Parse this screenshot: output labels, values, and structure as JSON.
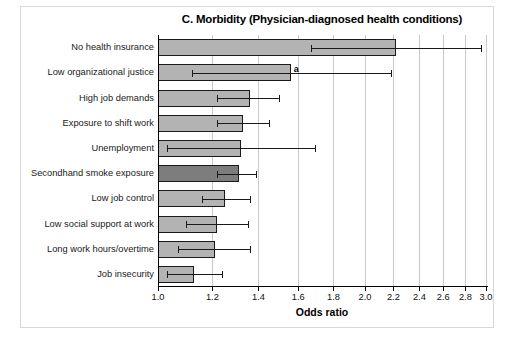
{
  "chart_data": {
    "type": "bar",
    "orientation": "horizontal",
    "title": "C. Morbidity (Physician-diagnosed health conditions)",
    "xlabel": "Odds ratio",
    "ylabel": "",
    "xscale": "log",
    "xlim": [
      1.0,
      3.0
    ],
    "grid": true,
    "legend": "none",
    "xticks": [
      1.0,
      1.2,
      1.4,
      1.6,
      1.8,
      2.0,
      2.2,
      2.4,
      2.6,
      2.8,
      3.0
    ],
    "xticklabels": [
      "1.0",
      "1.2",
      "1.4",
      "1.6",
      "1.8",
      "2.0",
      "2.2",
      "2.4",
      "2.6",
      "2.8",
      "3.0"
    ],
    "categories": [
      "No health insurance",
      "Low organizational justice",
      "High job demands",
      "Exposure to shift work",
      "Unemployment",
      "Secondhand smoke exposure",
      "Low job control",
      "Low social support at work",
      "Long work hours/overtime",
      "Job insecurity"
    ],
    "values": [
      2.22,
      1.56,
      1.36,
      1.33,
      1.32,
      1.31,
      1.25,
      1.22,
      1.21,
      1.13
    ],
    "ci_low": [
      1.67,
      1.12,
      1.22,
      1.22,
      1.03,
      1.22,
      1.16,
      1.1,
      1.07,
      1.03
    ],
    "ci_high": [
      2.95,
      2.18,
      1.5,
      1.45,
      1.69,
      1.39,
      1.36,
      1.35,
      1.36,
      1.24
    ],
    "highlight_index": 5,
    "annotations": [
      {
        "category": "Low organizational justice",
        "text": "a",
        "index": 1
      }
    ],
    "colors": {
      "bar_fill": "#b3b3b3",
      "bar_highlight_fill": "#7d7d7d",
      "bar_edge": "#1a1a1a",
      "error_bar": "#1a1a1a",
      "gridline": "#c9c9c9",
      "axis": "#000000",
      "background": "#ffffff"
    }
  }
}
